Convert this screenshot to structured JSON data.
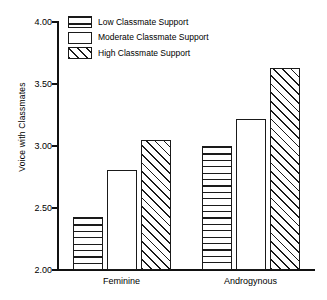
{
  "chart_data": {
    "type": "bar",
    "title": "",
    "xlabel": "",
    "ylabel": "Voice with Classmates",
    "categories": [
      "Feminine",
      "Androgynous"
    ],
    "series": [
      {
        "name": "Low Classmate Support",
        "pattern": "horizontal-stripes",
        "values": [
          2.43,
          3.0
        ]
      },
      {
        "name": "Moderate Classmate Support",
        "pattern": "blank-white",
        "values": [
          2.81,
          3.22
        ]
      },
      {
        "name": "High Classmate Support",
        "pattern": "diagonal-hatch",
        "values": [
          3.05,
          3.63
        ]
      }
    ],
    "ylim": [
      2.0,
      4.0
    ],
    "yticks": [
      "2.00",
      "2.50",
      "3.00",
      "3.50",
      "4.00"
    ],
    "ytick_values": [
      2.0,
      2.5,
      3.0,
      3.5,
      4.0
    ],
    "grid": false,
    "legend_position": "top-left-inside",
    "colors": {
      "ink": "#1a1a1a",
      "background": "#ffffff"
    }
  }
}
